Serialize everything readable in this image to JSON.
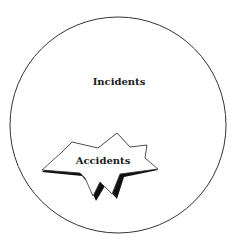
{
  "diagram": {
    "outer_set": {
      "label": "Incidents",
      "shape": "circle"
    },
    "inner_set": {
      "label": "Accidents",
      "shape": "starburst"
    }
  },
  "colors": {
    "stroke": "#333333",
    "shadow": "#111111",
    "fill": "#ffffff",
    "text": "#1a1a1a"
  }
}
